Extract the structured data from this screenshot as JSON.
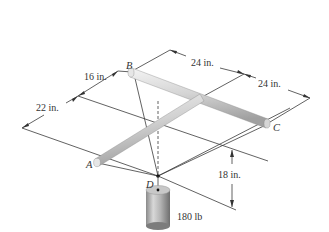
{
  "figure": {
    "points": {
      "A": "A",
      "B": "B",
      "C": "C",
      "D": "D"
    },
    "dimensions": {
      "bd_offset": "16 in.",
      "ad_offset": "22 in.",
      "b_to_junction": "24 in.",
      "junction_to_c": "24 in.",
      "d_drop": "18 in."
    },
    "load": {
      "label": "180 lb"
    },
    "colors": {
      "line": "#3a3a3a",
      "rod_light": "#ececec",
      "rod_dark": "#a8a8a8",
      "cylinder_light": "#d6d6d6",
      "cylinder_dark": "#7c7c7c",
      "text": "#333333"
    }
  }
}
